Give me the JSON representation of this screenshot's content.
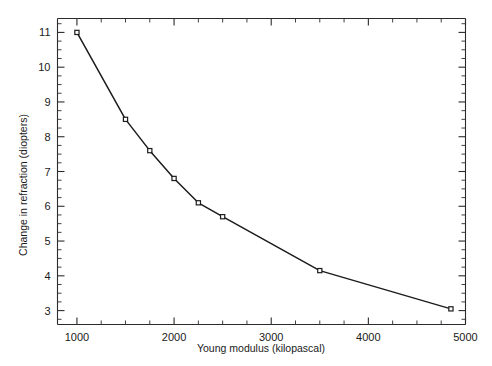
{
  "chart_data": {
    "type": "line",
    "title": "",
    "xlabel": "Young modulus (kilopascal)",
    "ylabel": "Change in refraction (diopters)",
    "xlim": [
      800,
      5000
    ],
    "ylim": [
      2.6,
      11.4
    ],
    "grid": false,
    "legend": "none",
    "x_ticks_major": [
      1000,
      2000,
      3000,
      4000,
      5000
    ],
    "x_tick_labels": [
      "1000",
      "2000",
      "3000",
      "4000",
      "5000"
    ],
    "x_tick_minor_step": 250,
    "y_ticks_major": [
      3,
      4,
      5,
      6,
      7,
      8,
      9,
      10,
      11
    ],
    "y_tick_labels": [
      "3",
      "4",
      "5",
      "6",
      "7",
      "8",
      "9",
      "10",
      "11"
    ],
    "y_tick_minor_step": 0.25,
    "marker": "square",
    "line_color": "#1c1c1c",
    "marker_face_color": "#ffffff",
    "marker_edge_color": "#1c1c1c",
    "x": [
      1000,
      1500,
      1750,
      2000,
      2250,
      2500,
      3500,
      4850
    ],
    "y": [
      11.0,
      8.5,
      7.6,
      6.8,
      6.1,
      5.7,
      4.15,
      3.05
    ],
    "series": [
      {
        "name": "Change in refraction vs Young modulus",
        "points": [
          {
            "x": 1000,
            "y": 11.0
          },
          {
            "x": 1500,
            "y": 8.5
          },
          {
            "x": 1750,
            "y": 7.6
          },
          {
            "x": 2000,
            "y": 6.8
          },
          {
            "x": 2250,
            "y": 6.1
          },
          {
            "x": 2500,
            "y": 5.7
          },
          {
            "x": 3500,
            "y": 4.15
          },
          {
            "x": 4850,
            "y": 3.05
          }
        ]
      }
    ]
  }
}
